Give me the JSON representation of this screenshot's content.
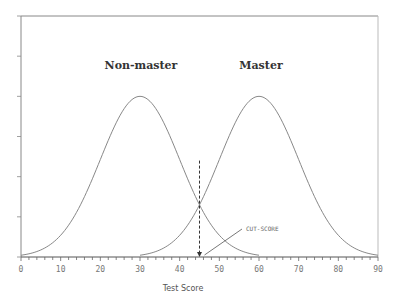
{
  "chart_data": {
    "type": "line",
    "title": "",
    "xlabel": "Test Score",
    "ylabel": "",
    "xlim": [
      0,
      90
    ],
    "ylim": [
      0,
      6
    ],
    "x_ticks": [
      "0",
      "10",
      "20",
      "30",
      "40",
      "50",
      "60",
      "70",
      "80",
      "90"
    ],
    "y_ticks_count": 7,
    "grid": false,
    "legend": "none",
    "series": [
      {
        "name": "Non-master",
        "distribution": "normal",
        "mean": 30,
        "sd": 10,
        "peak": 4,
        "x_range": [
          0,
          60
        ]
      },
      {
        "name": "Master",
        "distribution": "normal",
        "mean": 60,
        "sd": 10,
        "peak": 4,
        "x_range": [
          30,
          90
        ]
      }
    ],
    "annotations": [
      {
        "text": "Non-master",
        "x": 30,
        "y": 5.7
      },
      {
        "text": "Master",
        "x": 60,
        "y": 5.7
      },
      {
        "text": "CUT-SCORE",
        "x": 55,
        "y": 1.4,
        "arrow_to": [
          45,
          0
        ],
        "cut_line_x": 45
      }
    ]
  },
  "labels": {
    "xlabel": "Test Score",
    "nonmaster": "Non-master",
    "master": "Master",
    "cutscore": "CUT-SCORE",
    "ticks": [
      "0",
      "10",
      "20",
      "30",
      "40",
      "50",
      "60",
      "70",
      "80",
      "90"
    ]
  }
}
